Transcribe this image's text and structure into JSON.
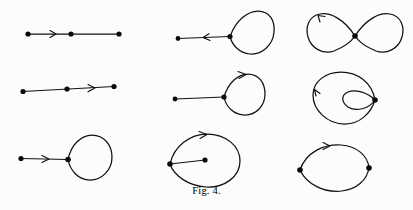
{
  "figure": {
    "caption": "Fig. 4.",
    "kind": "mathematical-diagram",
    "stroke_color": "#111111",
    "node_color": "#0b0b0b",
    "background_color": "#fcfcfa",
    "rows": 3,
    "columns": 3,
    "panels": [
      {
        "id": "r1c1",
        "row": 1,
        "column": 1,
        "name": "segment-three-nodes-arrow-left-span",
        "label": "",
        "nodes": 3,
        "loops": 0,
        "arrows": 1,
        "arrow_direction": "right",
        "arrow_position": "between first and second node"
      },
      {
        "id": "r1c2",
        "row": 1,
        "column": 2,
        "name": "loop-with-tail-arrow-inward",
        "label": "",
        "nodes": 2,
        "loops": 1,
        "arrows": 1,
        "arrow_direction": "left",
        "arrow_position": "on tail segment"
      },
      {
        "id": "r1c3",
        "row": 1,
        "column": 3,
        "name": "figure-eight-arrow-upper-left",
        "label": "",
        "nodes": 1,
        "loops": 2,
        "arrows": 1,
        "arrow_direction": "counterclockwise",
        "arrow_position": "upper left of left lobe"
      },
      {
        "id": "r2c1",
        "row": 2,
        "column": 1,
        "name": "segment-three-nodes-arrow-right-span",
        "label": "",
        "nodes": 3,
        "loops": 0,
        "arrows": 1,
        "arrow_direction": "right",
        "arrow_position": "between second and third node"
      },
      {
        "id": "r2c2",
        "row": 2,
        "column": 2,
        "name": "loop-with-tail-arrow-on-loop",
        "label": "",
        "nodes": 2,
        "loops": 1,
        "arrows": 1,
        "arrow_direction": "clockwise",
        "arrow_position": "top of loop"
      },
      {
        "id": "r2c3",
        "row": 2,
        "column": 3,
        "name": "nested-double-loop-arrow-left",
        "label": "",
        "nodes": 1,
        "loops": 2,
        "arrows": 1,
        "arrow_direction": "up",
        "arrow_position": "left side of outer loop"
      },
      {
        "id": "r3c1",
        "row": 3,
        "column": 1,
        "name": "loop-with-tail-arrow-on-tail-right",
        "label": "",
        "nodes": 2,
        "loops": 1,
        "arrows": 1,
        "arrow_direction": "right",
        "arrow_position": "on tail segment"
      },
      {
        "id": "r3c2",
        "row": 3,
        "column": 2,
        "name": "loop-with-interior-chord-arrow-top",
        "label": "",
        "nodes": 2,
        "loops": 1,
        "arrows": 1,
        "arrow_direction": "clockwise",
        "arrow_position": "top of loop"
      },
      {
        "id": "r3c3",
        "row": 3,
        "column": 3,
        "name": "bigon-two-nodes-arrow-top-arc",
        "label": "",
        "nodes": 2,
        "loops": 0,
        "arrows": 1,
        "arrow_direction": "right",
        "arrow_position": "on upper arc"
      }
    ]
  }
}
